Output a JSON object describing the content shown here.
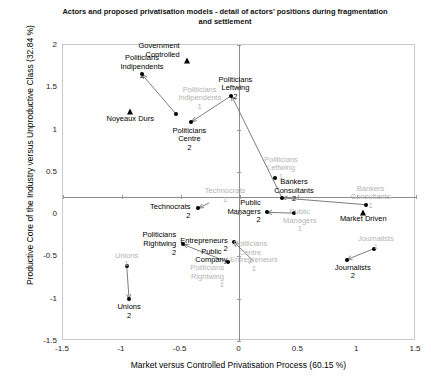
{
  "chart_data": {
    "type": "scatter",
    "title": "Actors and proposed privatisation models - detail of actors' positions during fragmentation and settlement",
    "xlabel": "Market versus Controlled Privatisation Process (60.15 %)",
    "ylabel": "Productive Core of the Industry versus Unproductive Class (32.84 %)",
    "xlim": [
      -1.5,
      1.5
    ],
    "ylim": [
      -1.5,
      2
    ],
    "xticks": [
      "-1.5",
      "-1",
      "-0.5",
      "0",
      "0.5",
      "1",
      "1.5"
    ],
    "xtick_values": [
      -1.5,
      -1,
      -0.5,
      0,
      0.5,
      1,
      1.5
    ],
    "yticks": [
      "-1.5",
      "-1",
      "-0.5",
      "0",
      "0.5",
      "1",
      "1.5",
      "2"
    ],
    "ytick_values": [
      -1.5,
      -1,
      -0.5,
      0,
      0.5,
      1,
      1.5,
      2
    ],
    "grid": false,
    "legend": "none",
    "axis_lines_at_zero": true,
    "points": [
      {
        "label": "Politicians Indipendents 2",
        "x": -0.82,
        "y": 1.64,
        "marker": "dot",
        "style": "dark",
        "label_pos": "above-center",
        "label_dx": 0,
        "label_dy": -20
      },
      {
        "label": "Politicians Indipendents 1",
        "x": -0.33,
        "y": 1.45,
        "marker": "none",
        "style": "pale",
        "label_pos": "center",
        "label_dx": 0,
        "label_dy": -5
      },
      {
        "label": "Government Controlled",
        "x": -0.44,
        "y": 1.8,
        "marker": "triangle",
        "style": "dark",
        "label_pos": "left-of",
        "label_dx": -7,
        "label_dy": -19
      },
      {
        "label": "Noyeaux Durs",
        "x": -0.92,
        "y": 1.2,
        "marker": "triangle",
        "style": "dark",
        "label_pos": "below-center",
        "label_dx": 0,
        "label_dy": 3
      },
      {
        "label": "",
        "x": -0.53,
        "y": 1.17,
        "marker": "dot",
        "style": "dark",
        "label_pos": "none",
        "label_dx": 0,
        "label_dy": 0
      },
      {
        "label": "Politicians Centre 2",
        "x": -0.4,
        "y": 1.08,
        "marker": "dot",
        "style": "dark",
        "label_pos": "below-center",
        "label_dx": -2,
        "label_dy": 5
      },
      {
        "label": "Politicians Leftwing 2",
        "x": -0.06,
        "y": 1.39,
        "marker": "dot",
        "style": "dark",
        "label_pos": "above-center",
        "label_dx": 4,
        "label_dy": -20
      },
      {
        "label": "Politicians Leftwing 1",
        "x": 0.31,
        "y": 0.42,
        "marker": "dot",
        "style": "pale",
        "label_pos": "above-center",
        "label_dx": 6,
        "label_dy": -22
      },
      {
        "label": "Bankers Consultants 2",
        "x": 0.37,
        "y": 0.18,
        "marker": "dot",
        "style": "dark",
        "label_pos": "above-center",
        "label_dx": 12,
        "label_dy": -20
      },
      {
        "label": "Bankers Consultants 1",
        "x": 1.08,
        "y": 0.1,
        "marker": "dot",
        "style": "pale",
        "label_pos": "above-center",
        "label_dx": 5,
        "label_dy": -20
      },
      {
        "label": "Market Driven",
        "x": 1.06,
        "y": 0.0,
        "marker": "triangle",
        "style": "dark",
        "label_pos": "center",
        "label_dx": 0,
        "label_dy": 2
      },
      {
        "label": "Public Managers 2",
        "x": 0.24,
        "y": 0.01,
        "marker": "dot",
        "style": "dark",
        "label_pos": "left-of",
        "label_dx": -6,
        "label_dy": -13
      },
      {
        "label": "Public Managers 1",
        "x": 0.47,
        "y": 0.0,
        "marker": "dot",
        "style": "pale",
        "label_pos": "right-of",
        "label_dx": 6,
        "label_dy": -5
      },
      {
        "label": "Technocrats 2",
        "x": -0.34,
        "y": 0.06,
        "marker": "dot",
        "style": "dark",
        "label_pos": "left-of",
        "label_dx": -8,
        "label_dy": -5
      },
      {
        "label": "Technocrats 1",
        "x": -0.25,
        "y": 0.14,
        "marker": "none",
        "style": "pale",
        "label_pos": "above-center",
        "label_dx": 16,
        "label_dy": -14
      },
      {
        "label": "Politicians Rightwing 2",
        "x": -0.47,
        "y": -0.37,
        "marker": "dot",
        "style": "dark",
        "label_pos": "left-of",
        "label_dx": -7,
        "label_dy": -13
      },
      {
        "label": "Entrepreneurs 2",
        "x": -0.04,
        "y": -0.34,
        "marker": "dot",
        "style": "dark",
        "label_pos": "left-of",
        "label_dx": -6,
        "label_dy": -5
      },
      {
        "label": "Public Company",
        "x": -0.23,
        "y": -0.47,
        "marker": "none",
        "style": "dark",
        "label_pos": "center",
        "label_dx": 0,
        "label_dy": -5
      },
      {
        "label": "Politicians Rightwing 1",
        "x": -0.09,
        "y": -0.58,
        "marker": "dot",
        "style": "pale",
        "label_pos": "left-of",
        "label_dx": -4,
        "label_dy": 2
      },
      {
        "label": "Politicians Centre 1",
        "x": 0.1,
        "y": -0.38,
        "marker": "none",
        "style": "pale",
        "label_pos": "center",
        "label_dx": 0,
        "label_dy": -5
      },
      {
        "label": "Entrepreneurs 1",
        "x": 0.13,
        "y": -0.57,
        "marker": "none",
        "style": "pale",
        "label_pos": "center",
        "label_dx": 0,
        "label_dy": -5
      },
      {
        "label": "Journalists 1",
        "x": 1.15,
        "y": -0.42,
        "marker": "dot",
        "style": "pale",
        "label_pos": "above-center",
        "label_dx": 2,
        "label_dy": -14
      },
      {
        "label": "Journalists 2",
        "x": 0.92,
        "y": -0.55,
        "marker": "dot",
        "style": "dark",
        "label_pos": "below-center",
        "label_dx": 6,
        "label_dy": 4
      },
      {
        "label": "Unions 1",
        "x": -0.95,
        "y": -0.62,
        "marker": "dot",
        "style": "pale",
        "label_pos": "above-center",
        "label_dx": 0,
        "label_dy": -14
      },
      {
        "label": "Unions 2",
        "x": -0.93,
        "y": -1.02,
        "marker": "dot",
        "style": "dark",
        "label_pos": "below-center",
        "label_dx": 0,
        "label_dy": 4
      }
    ],
    "arrows": [
      {
        "from": [
          -0.53,
          1.17
        ],
        "to": [
          -0.82,
          1.64
        ],
        "name": "indipendents-shift"
      },
      {
        "from": [
          0.37,
          0.18
        ],
        "to": [
          -0.06,
          1.39
        ],
        "name": "leftwing-shift"
      },
      {
        "from": [
          -0.06,
          1.39
        ],
        "to": [
          -0.4,
          1.08
        ],
        "name": "centre-shift"
      },
      {
        "from": [
          1.08,
          0.1
        ],
        "to": [
          0.37,
          0.18
        ],
        "name": "bankers-shift"
      },
      {
        "from": [
          0.47,
          0.0
        ],
        "to": [
          0.24,
          0.01
        ],
        "name": "managers-shift"
      },
      {
        "from": [
          -0.25,
          0.12
        ],
        "to": [
          -0.34,
          0.06
        ],
        "name": "technocrats-shift"
      },
      {
        "from": [
          -0.09,
          -0.58
        ],
        "to": [
          -0.47,
          -0.37
        ],
        "name": "rightwing-shift"
      },
      {
        "from": [
          0.13,
          -0.57
        ],
        "to": [
          -0.04,
          -0.34
        ],
        "name": "entrepreneurs-shift"
      },
      {
        "from": [
          1.15,
          -0.42
        ],
        "to": [
          0.92,
          -0.55
        ],
        "name": "journalists-shift"
      },
      {
        "from": [
          -0.95,
          -0.62
        ],
        "to": [
          -0.93,
          -1.02
        ],
        "name": "unions-shift"
      }
    ]
  }
}
